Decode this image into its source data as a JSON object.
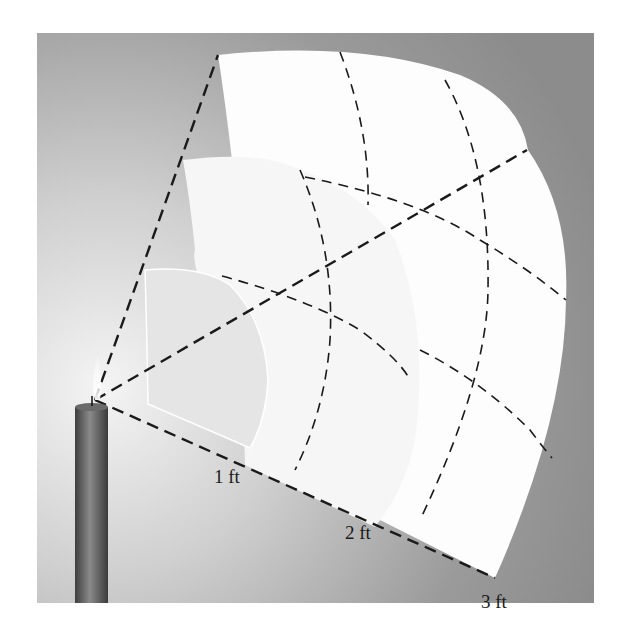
{
  "figure": {
    "labels": {
      "distance_1": "1 ft",
      "distance_2": "2 ft",
      "distance_3": "3 ft"
    },
    "colors": {
      "background_dark": "#8f8f8f",
      "background_light": "#f2f2f2",
      "panel_outer": "#fdfdfd",
      "panel_middle": "#f7f7f7",
      "panel_inner": "#e6e6e6",
      "dash": "#1a1a1a",
      "candle": "#5a5a5a"
    }
  }
}
